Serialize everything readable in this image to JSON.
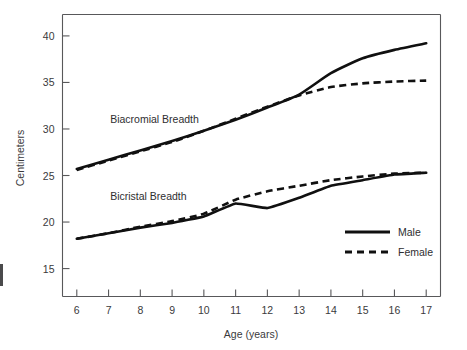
{
  "chart_data": {
    "type": "line",
    "title": "",
    "subtitle": "",
    "xlabel": "Age (years)",
    "ylabel": "Centimeters",
    "x": [
      6,
      7,
      8,
      9,
      10,
      11,
      12,
      13,
      14,
      15,
      16,
      17
    ],
    "xlim": [
      5.55,
      17.45
    ],
    "ylim": [
      12.0,
      42.3
    ],
    "xticks": [
      "6",
      "7",
      "8",
      "9",
      "10",
      "11",
      "12",
      "13",
      "14",
      "15",
      "16",
      "17"
    ],
    "yticks": [
      "15",
      "20",
      "25",
      "30",
      "35",
      "40"
    ],
    "ytick_values": [
      15,
      20,
      25,
      30,
      35,
      40
    ],
    "grid": false,
    "legend_position": "lower-right",
    "legend": [
      {
        "name": "Male",
        "style": "solid"
      },
      {
        "name": "Female",
        "style": "dashed"
      }
    ],
    "annotations": [
      {
        "text": "Biacromial Breadth",
        "x": 7.05,
        "y": 30.6
      },
      {
        "text": "Bicristal Breadth",
        "x": 7.05,
        "y": 22.4
      }
    ],
    "series": [
      {
        "name": "Biacromial Breadth — Male",
        "measure": "Biacromial Breadth",
        "sex": "Male",
        "style": "solid",
        "color": "#101010",
        "values": [
          25.7,
          26.7,
          27.7,
          28.7,
          29.8,
          31.0,
          32.3,
          33.7,
          36.0,
          37.6,
          38.5,
          39.2
        ]
      },
      {
        "name": "Biacromial Breadth — Female",
        "measure": "Biacromial Breadth",
        "sex": "Female",
        "style": "dashed",
        "color": "#101010",
        "values": [
          25.6,
          26.6,
          27.6,
          28.6,
          29.8,
          31.1,
          32.4,
          33.6,
          34.5,
          34.9,
          35.1,
          35.2
        ]
      },
      {
        "name": "Bicristal Breadth — Male",
        "measure": "Bicristal Breadth",
        "sex": "Male",
        "style": "solid",
        "color": "#101010",
        "values": [
          18.2,
          18.8,
          19.4,
          19.9,
          20.6,
          22.0,
          21.5,
          22.6,
          23.9,
          24.5,
          25.1,
          25.3
        ]
      },
      {
        "name": "Bicristal Breadth — Female",
        "measure": "Bicristal Breadth",
        "sex": "Female",
        "style": "dashed",
        "color": "#101010",
        "values": [
          18.2,
          18.8,
          19.5,
          20.1,
          20.9,
          22.4,
          23.3,
          23.9,
          24.5,
          24.9,
          25.2,
          25.3
        ]
      }
    ]
  }
}
